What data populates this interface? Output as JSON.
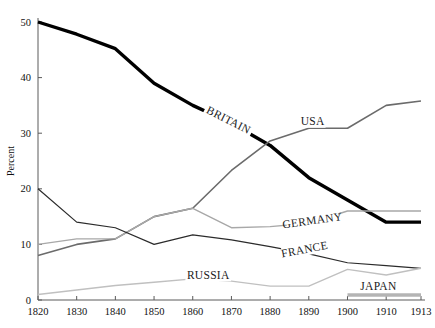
{
  "chart_data": {
    "type": "line",
    "title": "",
    "subtitle": "",
    "xlabel": "",
    "ylabel": "Percent",
    "xlim": [
      1820,
      1913
    ],
    "ylim": [
      0,
      50
    ],
    "grid": false,
    "legend_position": "inline-labels",
    "x_ticks": [
      1820,
      1830,
      1840,
      1850,
      1860,
      1870,
      1880,
      1890,
      1900,
      1910,
      1913
    ],
    "x_tick_labels": [
      "1820",
      "1830",
      "1840",
      "1850",
      "1860",
      "1870",
      "1880",
      "1890",
      "1900",
      "1910",
      "1913"
    ],
    "y_ticks": [
      0,
      10,
      20,
      30,
      40,
      50
    ],
    "y_tick_labels": [
      "0",
      "10",
      "20",
      "30",
      "40",
      "50"
    ],
    "x": [
      1820,
      1830,
      1840,
      1850,
      1860,
      1870,
      1880,
      1890,
      1900,
      1910,
      1913
    ],
    "series": [
      {
        "name": "BRITAIN",
        "color": "#000000",
        "width": 3.4,
        "values": [
          50.0,
          47.8,
          45.2,
          39.0,
          35.0,
          31.8,
          27.8,
          22.0,
          18.0,
          14.0,
          14.0
        ]
      },
      {
        "name": "USA",
        "color": "#6b6b6b",
        "width": 1.6,
        "values": [
          8.0,
          10.0,
          11.0,
          15.0,
          16.5,
          23.3,
          28.6,
          30.9,
          30.9,
          35.0,
          35.8
        ]
      },
      {
        "name": "GERMANY",
        "color": "#a8a8a8",
        "width": 1.4,
        "values": [
          10.0,
          11.0,
          11.0,
          15.0,
          16.5,
          13.0,
          13.2,
          13.8,
          16.0,
          16.0,
          16.0
        ]
      },
      {
        "name": "FRANCE",
        "color": "#2b2b2b",
        "width": 1.2,
        "values": [
          20.0,
          14.0,
          13.0,
          10.0,
          11.7,
          10.8,
          9.6,
          8.3,
          6.7,
          6.2,
          5.7
        ]
      },
      {
        "name": "RUSSIA",
        "color": "#c0c0c0",
        "width": 1.4,
        "values": [
          1.0,
          1.8,
          2.6,
          3.2,
          3.8,
          3.4,
          2.5,
          2.5,
          5.5,
          4.5,
          5.7
        ]
      },
      {
        "name": "JAPAN",
        "color": "#b4b4b4",
        "width": 3.6,
        "values": [
          null,
          null,
          null,
          null,
          null,
          null,
          null,
          null,
          0.9,
          0.9,
          0.9
        ]
      }
    ],
    "annotations": [
      {
        "text": "BRITAIN",
        "x": 1869,
        "y": 32.0,
        "rotation": 27
      },
      {
        "text": "USA",
        "x": 1891,
        "y": 31.7,
        "rotation": 0
      },
      {
        "text": "GERMANY",
        "x": 1891,
        "y": 13.9,
        "rotation": -8
      },
      {
        "text": "FRANCE",
        "x": 1889,
        "y": 8.7,
        "rotation": -11
      },
      {
        "text": "RUSSIA",
        "x": 1864,
        "y": 4.1,
        "rotation": 0
      },
      {
        "text": "JAPAN",
        "x": 1908,
        "y": 2.0,
        "rotation": 0
      }
    ]
  },
  "axis": {
    "y_title": "Percent"
  }
}
